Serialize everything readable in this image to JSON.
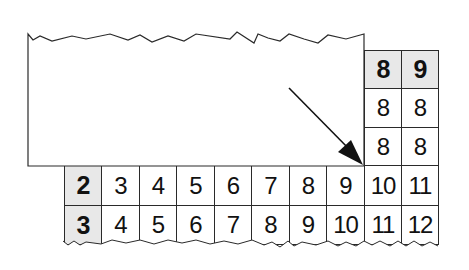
{
  "diagram": {
    "colors": {
      "line": "#2a2a2a",
      "header_fill": "#e8e8e8",
      "cell_fill": "#ffffff",
      "text": "#111111"
    },
    "top_right_block": {
      "header": [
        "8",
        "9"
      ],
      "rows": [
        [
          "8",
          "8"
        ],
        [
          "8",
          "8"
        ]
      ]
    },
    "bottom_block": {
      "rows": [
        {
          "header": "2",
          "values": [
            "3",
            "4",
            "5",
            "6",
            "7",
            "8",
            "9",
            "10",
            "11"
          ]
        },
        {
          "header": "3",
          "values": [
            "4",
            "5",
            "6",
            "7",
            "8",
            "9",
            "10",
            "11",
            "12"
          ]
        }
      ]
    },
    "arrow": {
      "direction": "down-right",
      "target": "hidden-corner-cell"
    },
    "cover_sheet": {
      "shape": "torn-paper",
      "edge": "top-zigzag"
    }
  }
}
